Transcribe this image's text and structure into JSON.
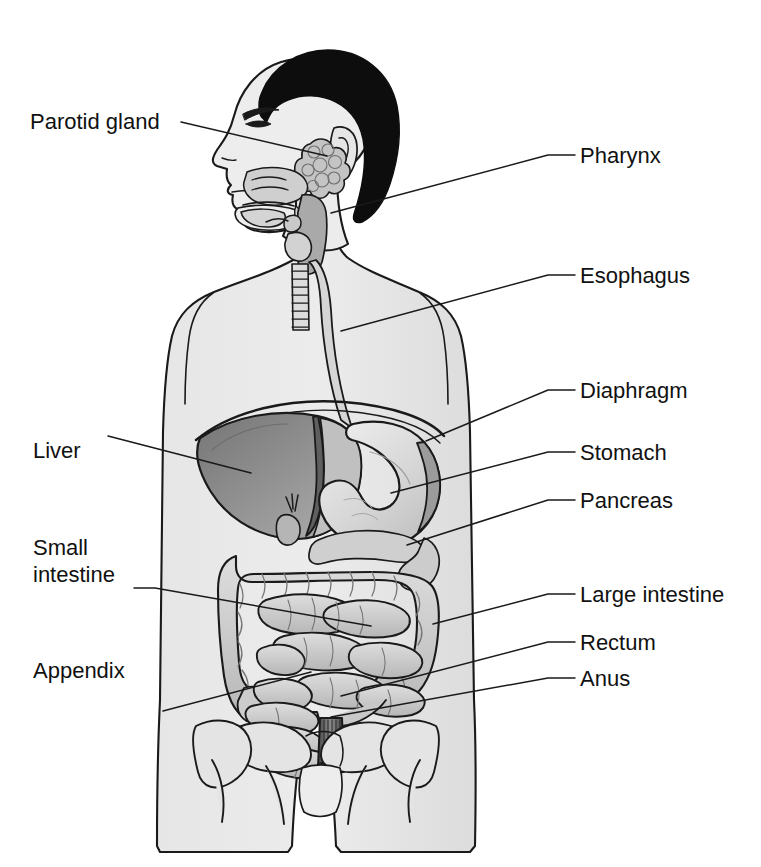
{
  "diagram": {
    "orientation": "anterior view of male torso with head in profile",
    "style": {
      "background": "#ffffff",
      "line_color": "#1a1a1a",
      "text_color": "#111111",
      "body_fill": "#e2e2e2",
      "skin_fill": "#ebebeb",
      "hair_fill": "#0d0d0d",
      "organ_light": "#d8d8d8",
      "organ_mid": "#b9b9b9",
      "organ_dark": "#8a8a8a",
      "liver_fill": "#9a9a9a",
      "rectum_fill": "#6f6f6f"
    },
    "labels": [
      {
        "id": "parotid-gland",
        "text": "Parotid gland",
        "side": "left",
        "x": 30,
        "y": 108,
        "leader": [
          [
            181,
            122
          ],
          [
            327,
            156
          ]
        ]
      },
      {
        "id": "pharynx",
        "text": "Pharynx",
        "side": "right",
        "x": 580,
        "y": 142,
        "leader": [
          [
            575,
            155
          ],
          [
            548,
            155
          ],
          [
            331,
            213
          ]
        ]
      },
      {
        "id": "esophagus",
        "text": "Esophagus",
        "side": "right",
        "x": 580,
        "y": 262,
        "leader": [
          [
            575,
            275
          ],
          [
            548,
            275
          ],
          [
            341,
            331
          ]
        ]
      },
      {
        "id": "diaphragm",
        "text": "Diaphragm",
        "side": "right",
        "x": 580,
        "y": 377,
        "leader": [
          [
            575,
            390
          ],
          [
            548,
            390
          ],
          [
            426,
            441
          ]
        ]
      },
      {
        "id": "liver",
        "text": "Liver",
        "side": "left",
        "x": 33,
        "y": 437,
        "leader": [
          [
            108,
            436
          ],
          [
            251,
            473
          ]
        ]
      },
      {
        "id": "stomach",
        "text": "Stomach",
        "side": "right",
        "x": 580,
        "y": 439,
        "leader": [
          [
            575,
            452
          ],
          [
            548,
            452
          ],
          [
            391,
            493
          ]
        ]
      },
      {
        "id": "pancreas",
        "text": "Pancreas",
        "side": "right",
        "x": 580,
        "y": 487,
        "leader": [
          [
            575,
            500
          ],
          [
            548,
            500
          ],
          [
            407,
            545
          ]
        ]
      },
      {
        "id": "small-intestine",
        "text": "Small\nintestine",
        "side": "left",
        "x": 33,
        "y": 534,
        "leader": [
          [
            134,
            588
          ],
          [
            155,
            588
          ],
          [
            371,
            626
          ]
        ]
      },
      {
        "id": "large-intestine",
        "text": "Large intestine",
        "side": "right",
        "x": 580,
        "y": 581,
        "leader": [
          [
            575,
            594
          ],
          [
            548,
            594
          ],
          [
            433,
            624
          ]
        ]
      },
      {
        "id": "rectum",
        "text": "Rectum",
        "side": "right",
        "x": 580,
        "y": 629,
        "leader": [
          [
            575,
            642
          ],
          [
            548,
            642
          ],
          [
            341,
            696
          ]
        ]
      },
      {
        "id": "anus",
        "text": "Anus",
        "side": "right",
        "x": 580,
        "y": 665,
        "leader": [
          [
            575,
            678
          ],
          [
            548,
            678
          ],
          [
            331,
            717
          ]
        ]
      },
      {
        "id": "appendix",
        "text": "Appendix",
        "side": "left",
        "x": 33,
        "y": 657,
        "leader": [
          [
            163,
            711
          ],
          [
            311,
            672
          ]
        ]
      }
    ]
  }
}
